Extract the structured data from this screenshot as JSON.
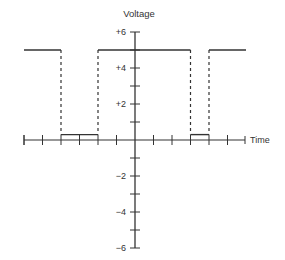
{
  "chart_data": {
    "type": "line",
    "title": "",
    "xlabel": "Time",
    "ylabel": "Voltage",
    "xlim": [
      -6,
      6
    ],
    "ylim": [
      -6,
      6
    ],
    "y_tick_labels": [
      {
        "value": 6,
        "label": "+6"
      },
      {
        "value": 4,
        "label": "+4"
      },
      {
        "value": 2,
        "label": "+2"
      },
      {
        "value": -2,
        "label": "−2"
      },
      {
        "value": -4,
        "label": "−4"
      },
      {
        "value": -6,
        "label": "−6"
      }
    ],
    "y_minor_ticks": [
      6,
      5,
      4,
      3,
      2,
      1,
      -1,
      -2,
      -3,
      -4,
      -5,
      -6
    ],
    "x_ticks": [
      -6,
      -5,
      -4,
      -3,
      -2,
      -1,
      1,
      2,
      3,
      4,
      5
    ],
    "grid": false,
    "series": [
      {
        "name": "square-wave",
        "high_level": 5,
        "low_level": 0.3,
        "segments": [
          {
            "x0": -6,
            "x1": -4,
            "level": "high"
          },
          {
            "x0": -4,
            "x1": -2,
            "level": "low"
          },
          {
            "x0": -2,
            "x1": 3,
            "level": "high"
          },
          {
            "x0": 3,
            "x1": 4,
            "level": "low"
          },
          {
            "x0": 4,
            "x1": 6,
            "level": "high"
          }
        ],
        "transitions": [
          -4,
          -2,
          3,
          4
        ],
        "transition_style": "dashed"
      }
    ]
  },
  "colors": {
    "axis": "#333333",
    "wave": "#333333"
  }
}
